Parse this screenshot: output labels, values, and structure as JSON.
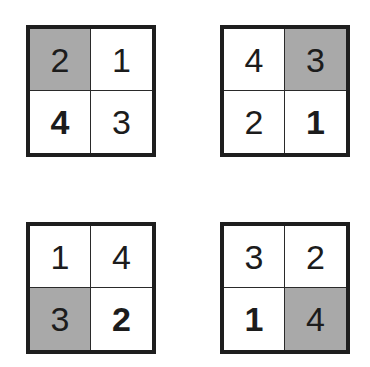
{
  "figure": {
    "shade_color": "#a9a9a9",
    "border_color": "#1e1e1e",
    "grids": [
      {
        "position": "top-left",
        "cells": [
          {
            "value": "2",
            "shaded": true,
            "bold": false
          },
          {
            "value": "1",
            "shaded": false,
            "bold": false
          },
          {
            "value": "4",
            "shaded": false,
            "bold": true
          },
          {
            "value": "3",
            "shaded": false,
            "bold": false
          }
        ]
      },
      {
        "position": "top-right",
        "cells": [
          {
            "value": "4",
            "shaded": false,
            "bold": false
          },
          {
            "value": "3",
            "shaded": true,
            "bold": false
          },
          {
            "value": "2",
            "shaded": false,
            "bold": false
          },
          {
            "value": "1",
            "shaded": false,
            "bold": true
          }
        ]
      },
      {
        "position": "bottom-left",
        "cells": [
          {
            "value": "1",
            "shaded": false,
            "bold": false
          },
          {
            "value": "4",
            "shaded": false,
            "bold": false
          },
          {
            "value": "3",
            "shaded": true,
            "bold": false
          },
          {
            "value": "2",
            "shaded": false,
            "bold": true
          }
        ]
      },
      {
        "position": "bottom-right",
        "cells": [
          {
            "value": "3",
            "shaded": false,
            "bold": false
          },
          {
            "value": "2",
            "shaded": false,
            "bold": false
          },
          {
            "value": "1",
            "shaded": false,
            "bold": true
          },
          {
            "value": "4",
            "shaded": true,
            "bold": false
          }
        ]
      }
    ]
  }
}
